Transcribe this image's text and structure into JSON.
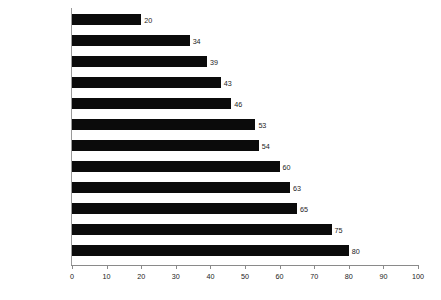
{
  "chart_data": {
    "type": "bar",
    "orientation": "horizontal",
    "title": "",
    "subtitle": "",
    "xlabel": "",
    "ylabel": "",
    "xlim": [
      0,
      100
    ],
    "xticks": [
      0,
      10,
      20,
      30,
      40,
      50,
      60,
      70,
      80,
      90,
      100
    ],
    "grid": false,
    "legend": false,
    "bar_color": "#0b0b0b",
    "axis_color": "#8a8a8a",
    "text_color": "#1b1b1b",
    "show_value_labels": true,
    "categories": [
      "Administration",
      "Marketing",
      "Manufacturing",
      "R&D",
      "Finance",
      "Public Sector",
      "Logistics",
      "Personnel",
      "Technical",
      "Computing",
      "Secretarial",
      "Legal"
    ],
    "values": [
      20,
      34,
      39,
      43,
      46,
      53,
      54,
      60,
      63,
      65,
      75,
      80
    ],
    "value_labels": [
      "20",
      "34",
      "39",
      "43",
      "46",
      "53",
      "54",
      "60",
      "63",
      "65",
      "75",
      "80"
    ],
    "tick_labels": [
      "0",
      "10",
      "20",
      "30",
      "40",
      "50",
      "60",
      "70",
      "80",
      "90",
      "100"
    ]
  }
}
